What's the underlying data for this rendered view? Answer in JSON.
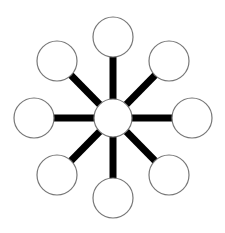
{
  "diagram": {
    "type": "hub-and-spoke",
    "colors": {
      "background": "#ffffff",
      "node_fill": "#ffffff",
      "node_stroke": "#777777",
      "spoke": "#000000"
    },
    "hub": {
      "id": "hub",
      "cx": 113,
      "cy": 118,
      "r": 19,
      "label": ""
    },
    "spoke_width": 7,
    "nodes": [
      {
        "id": "node-top",
        "cx": 113,
        "cy": 37,
        "r": 20,
        "label": ""
      },
      {
        "id": "node-upper-right",
        "cx": 169,
        "cy": 61,
        "r": 20,
        "label": ""
      },
      {
        "id": "node-right",
        "cx": 192,
        "cy": 118,
        "r": 20,
        "label": ""
      },
      {
        "id": "node-lower-right",
        "cx": 169,
        "cy": 175,
        "r": 20,
        "label": ""
      },
      {
        "id": "node-bottom",
        "cx": 113,
        "cy": 198,
        "r": 20,
        "label": ""
      },
      {
        "id": "node-lower-left",
        "cx": 57,
        "cy": 175,
        "r": 20,
        "label": ""
      },
      {
        "id": "node-left",
        "cx": 34,
        "cy": 118,
        "r": 20,
        "label": ""
      },
      {
        "id": "node-upper-left",
        "cx": 57,
        "cy": 61,
        "r": 20,
        "label": ""
      }
    ]
  }
}
